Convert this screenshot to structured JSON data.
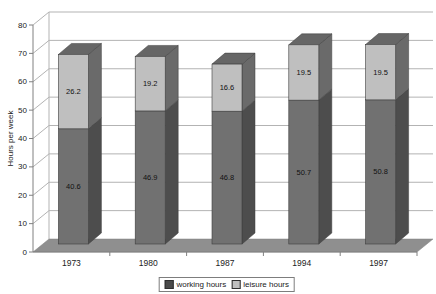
{
  "chart_data": {
    "type": "bar",
    "subtype": "stacked-3d-column",
    "title": "",
    "xlabel": "",
    "ylabel": "Hours per week",
    "categories": [
      "1973",
      "1980",
      "1987",
      "1994",
      "1997"
    ],
    "series": [
      {
        "name": "working hours",
        "values": [
          40.6,
          46.9,
          46.8,
          50.7,
          50.8
        ],
        "front_color": "#717171",
        "side_color": "#4d4d4d"
      },
      {
        "name": "leisure hours",
        "values": [
          26.2,
          19.2,
          16.6,
          19.5,
          19.5
        ],
        "front_color": "#bfbfbf",
        "side_color": "#6a6a6a"
      }
    ],
    "data_labels": true,
    "ylim": [
      0,
      80
    ],
    "ytick_step": 10,
    "ytick_labels": [
      "0",
      "10",
      "20",
      "30",
      "40",
      "50",
      "60",
      "70",
      "80"
    ],
    "grid": true,
    "legend_position": "bottom-center",
    "colors": {
      "cap_top": "#666666",
      "floor": "#8f8f8f",
      "gridline": "#b3b3b3",
      "axis": "#808080",
      "label_text": "#111111",
      "tick_text": "#222222",
      "outline": "#3d3d3d",
      "background": "#ffffff"
    }
  }
}
